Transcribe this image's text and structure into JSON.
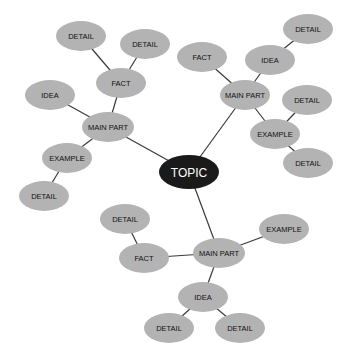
{
  "diagram": {
    "type": "mind-map",
    "colors": {
      "node_fill": "#b3b3b3",
      "root_fill": "#1a1a1a",
      "edge": "#3a3a3a",
      "root_text": "#ffffff",
      "text": "#111111"
    },
    "nodes": [
      {
        "id": "topic",
        "label": "TOPIC",
        "x": 189,
        "y": 172,
        "rx": 30,
        "ry": 17,
        "root": true
      },
      {
        "id": "mp_ul",
        "label": "MAIN PART",
        "x": 108,
        "y": 127,
        "rx": 26,
        "ry": 15
      },
      {
        "id": "fact_ul",
        "label": "FACT",
        "x": 121,
        "y": 83,
        "rx": 25,
        "ry": 15
      },
      {
        "id": "detail_ul1",
        "label": "DETAIL",
        "x": 81,
        "y": 36,
        "rx": 25,
        "ry": 15
      },
      {
        "id": "detail_ul2",
        "label": "DETAIL",
        "x": 145,
        "y": 44,
        "rx": 25,
        "ry": 15
      },
      {
        "id": "idea_ul",
        "label": "IDEA",
        "x": 50,
        "y": 95,
        "rx": 25,
        "ry": 15
      },
      {
        "id": "example_ul",
        "label": "EXAMPLE",
        "x": 67,
        "y": 158,
        "rx": 25,
        "ry": 15
      },
      {
        "id": "detail_ul3",
        "label": "DETAIL",
        "x": 44,
        "y": 196,
        "rx": 25,
        "ry": 15
      },
      {
        "id": "mp_ur",
        "label": "MAIN PART",
        "x": 245,
        "y": 95,
        "rx": 25,
        "ry": 15
      },
      {
        "id": "fact_ur",
        "label": "FACT",
        "x": 202,
        "y": 57,
        "rx": 25,
        "ry": 15
      },
      {
        "id": "idea_ur",
        "label": "IDEA",
        "x": 270,
        "y": 60,
        "rx": 25,
        "ry": 15
      },
      {
        "id": "detail_ur1",
        "label": "DETAIL",
        "x": 308,
        "y": 29,
        "rx": 25,
        "ry": 15
      },
      {
        "id": "detail_ur2",
        "label": "DETAIL",
        "x": 307,
        "y": 100,
        "rx": 25,
        "ry": 15
      },
      {
        "id": "example_ur",
        "label": "EXAMPLE",
        "x": 275,
        "y": 134,
        "rx": 25,
        "ry": 15
      },
      {
        "id": "detail_ur3",
        "label": "DETAIL",
        "x": 308,
        "y": 163,
        "rx": 25,
        "ry": 15
      },
      {
        "id": "mp_b",
        "label": "MAIN PART",
        "x": 219,
        "y": 253,
        "rx": 26,
        "ry": 15
      },
      {
        "id": "detail_bl",
        "label": "DETAIL",
        "x": 125,
        "y": 219,
        "rx": 25,
        "ry": 15
      },
      {
        "id": "fact_b",
        "label": "FACT",
        "x": 144,
        "y": 258,
        "rx": 25,
        "ry": 15
      },
      {
        "id": "example_b",
        "label": "EXAMPLE",
        "x": 284,
        "y": 229,
        "rx": 25,
        "ry": 15
      },
      {
        "id": "idea_b",
        "label": "IDEA",
        "x": 203,
        "y": 297,
        "rx": 25,
        "ry": 15
      },
      {
        "id": "detail_b1",
        "label": "DETAIL",
        "x": 169,
        "y": 328,
        "rx": 25,
        "ry": 15
      },
      {
        "id": "detail_b2",
        "label": "DETAIL",
        "x": 240,
        "y": 328,
        "rx": 25,
        "ry": 15
      }
    ],
    "edges": [
      [
        "topic",
        "mp_ul"
      ],
      [
        "mp_ul",
        "fact_ul"
      ],
      [
        "fact_ul",
        "detail_ul1"
      ],
      [
        "fact_ul",
        "detail_ul2"
      ],
      [
        "mp_ul",
        "idea_ul"
      ],
      [
        "mp_ul",
        "example_ul"
      ],
      [
        "example_ul",
        "detail_ul3"
      ],
      [
        "topic",
        "mp_ur"
      ],
      [
        "mp_ur",
        "fact_ur"
      ],
      [
        "mp_ur",
        "idea_ur"
      ],
      [
        "idea_ur",
        "detail_ur1"
      ],
      [
        "mp_ur",
        "example_ur"
      ],
      [
        "example_ur",
        "detail_ur2"
      ],
      [
        "example_ur",
        "detail_ur3"
      ],
      [
        "topic",
        "mp_b"
      ],
      [
        "mp_b",
        "fact_b"
      ],
      [
        "fact_b",
        "detail_bl"
      ],
      [
        "mp_b",
        "example_b"
      ],
      [
        "mp_b",
        "idea_b"
      ],
      [
        "idea_b",
        "detail_b1"
      ],
      [
        "idea_b",
        "detail_b2"
      ]
    ]
  }
}
